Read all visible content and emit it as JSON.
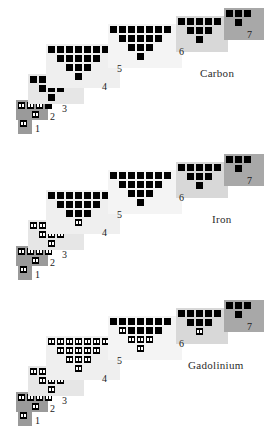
{
  "figure": {
    "title": "",
    "panel_count": 3
  },
  "geometry": {
    "panel_height": 146,
    "cell": 7,
    "gap": 2,
    "dot": 2
  },
  "shell_layout": [
    {
      "num": "1",
      "x": 18,
      "y": 118,
      "w": 14,
      "h": 16,
      "shade": "#9a9a9a",
      "rows": [
        1
      ],
      "label_x": 35,
      "label_y": 124,
      "label_size": 10
    },
    {
      "num": "2",
      "x": 16,
      "y": 100,
      "w": 32,
      "h": 20,
      "shade": "#9a9a9a",
      "rows": [
        4,
        1
      ],
      "label_x": 50,
      "label_y": 112,
      "label_size": 10
    },
    {
      "num": "3",
      "x": 28,
      "y": 74,
      "w": 56,
      "h": 30,
      "shade": "#e6e6e6",
      "rows": [
        5,
        3,
        1
      ],
      "label_x": 62,
      "label_y": 104,
      "label_size": 10
    },
    {
      "num": "4",
      "x": 46,
      "y": 44,
      "w": 74,
      "h": 44,
      "shade": "#efefef",
      "rows": [
        7,
        5,
        3,
        1
      ],
      "label_x": 102,
      "label_y": 82,
      "label_size": 10
    },
    {
      "num": "5",
      "x": 108,
      "y": 24,
      "w": 74,
      "h": 44,
      "shade": "#f4f4f4",
      "rows": [
        7,
        5,
        3,
        1
      ],
      "label_x": 117,
      "label_y": 64,
      "label_size": 10
    },
    {
      "num": "6",
      "x": 176,
      "y": 16,
      "w": 52,
      "h": 36,
      "shade": "#d8d8d8",
      "rows": [
        5,
        3,
        1
      ],
      "label_x": 179,
      "label_y": 47,
      "label_size": 10
    },
    {
      "num": "7",
      "x": 224,
      "y": 8,
      "w": 40,
      "h": 32,
      "shade": "#a8a8a8",
      "rows": [
        3,
        1
      ],
      "label_x": 247,
      "label_y": 30,
      "label_size": 10
    }
  ],
  "elements": [
    {
      "name": "Carbon",
      "label_x": 200,
      "label_y": 68,
      "filled": {
        "1": [
          [
            1
          ]
        ],
        "2": [
          [
            1,
            1,
            1,
            0
          ],
          [
            1
          ]
        ],
        "3": [
          [
            0,
            0,
            0,
            0,
            0
          ],
          [
            0,
            0,
            0
          ],
          [
            0
          ]
        ],
        "4": [
          [
            0,
            0,
            0,
            0,
            0,
            0,
            0
          ],
          [
            0,
            0,
            0,
            0,
            0
          ],
          [
            0,
            0,
            0
          ],
          [
            0
          ]
        ],
        "5": [
          [
            0,
            0,
            0,
            0,
            0,
            0,
            0
          ],
          [
            0,
            0,
            0,
            0,
            0
          ],
          [
            0,
            0,
            0
          ],
          [
            0
          ]
        ],
        "6": [
          [
            0,
            0,
            0,
            0,
            0
          ],
          [
            0,
            0,
            0
          ],
          [
            0
          ]
        ],
        "7": [
          [
            0,
            0,
            0
          ],
          [
            0
          ]
        ]
      }
    },
    {
      "name": "Iron",
      "label_x": 212,
      "label_y": 68,
      "filled": {
        "1": [
          [
            1
          ]
        ],
        "2": [
          [
            1,
            1,
            1,
            1
          ],
          [
            1
          ]
        ],
        "3": [
          [
            1,
            1,
            1,
            1,
            1
          ],
          [
            1,
            1,
            1
          ],
          [
            1
          ]
        ],
        "4": [
          [
            0,
            0,
            0,
            0,
            0,
            0,
            0
          ],
          [
            0,
            0,
            0,
            0,
            0
          ],
          [
            0,
            0,
            0
          ],
          [
            1
          ]
        ],
        "5": [
          [
            0,
            0,
            0,
            0,
            0,
            0,
            0
          ],
          [
            0,
            0,
            0,
            0,
            0
          ],
          [
            0,
            0,
            0
          ],
          [
            0
          ]
        ],
        "6": [
          [
            0,
            0,
            0,
            0,
            0
          ],
          [
            0,
            0,
            0
          ],
          [
            0
          ]
        ],
        "7": [
          [
            0,
            0,
            0
          ],
          [
            0
          ]
        ]
      }
    },
    {
      "name": "Gadolinium",
      "label_x": 188,
      "label_y": 68,
      "filled": {
        "1": [
          [
            1
          ]
        ],
        "2": [
          [
            1,
            1,
            1,
            1
          ],
          [
            1
          ]
        ],
        "3": [
          [
            1,
            1,
            1,
            1,
            1
          ],
          [
            1,
            1,
            1
          ],
          [
            1
          ]
        ],
        "4": [
          [
            1,
            1,
            1,
            1,
            1,
            1,
            1
          ],
          [
            1,
            1,
            1,
            1,
            1
          ],
          [
            1,
            1,
            1
          ],
          [
            1
          ]
        ],
        "5": [
          [
            0,
            0,
            0,
            0,
            0,
            0,
            0
          ],
          [
            1,
            0,
            0,
            0,
            0
          ],
          [
            1,
            1,
            1
          ],
          [
            1
          ]
        ],
        "6": [
          [
            0,
            0,
            0,
            0,
            0
          ],
          [
            0,
            0,
            0
          ],
          [
            1
          ]
        ],
        "7": [
          [
            0,
            0,
            0
          ],
          [
            0
          ]
        ]
      }
    }
  ]
}
